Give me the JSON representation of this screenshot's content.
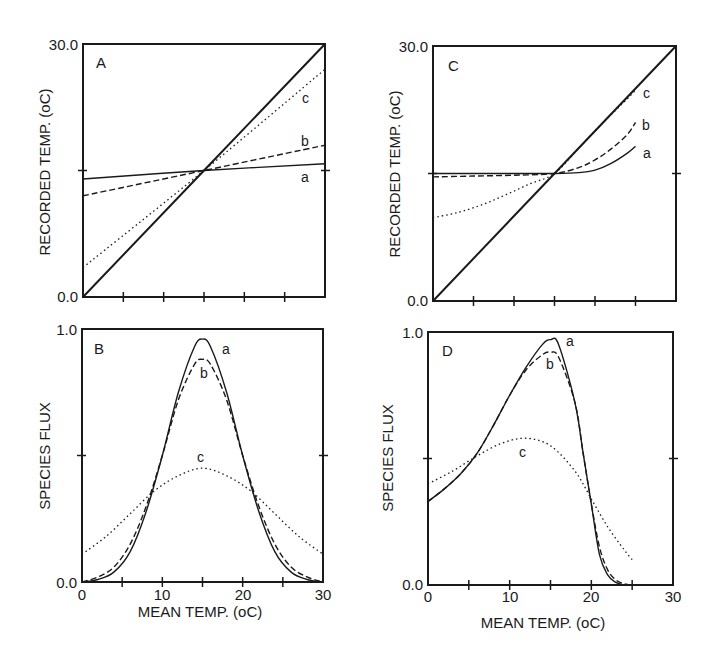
{
  "chart_data": [
    {
      "panel": "A",
      "type": "line",
      "xlabel": "",
      "ylabel": "RECORDED TEMP. (oC)",
      "xlim": [
        0,
        30
      ],
      "ylim": [
        0,
        30
      ],
      "yticks": [
        "0.0",
        "30.0"
      ],
      "grid": false,
      "series": [
        {
          "name": "1:1",
          "style": "solid-thick",
          "x": [
            0,
            30
          ],
          "y": [
            0,
            30
          ]
        },
        {
          "name": "a",
          "style": "solid",
          "x": [
            0,
            15,
            30
          ],
          "y": [
            14.0,
            15.0,
            15.8
          ]
        },
        {
          "name": "b",
          "style": "dashed",
          "x": [
            0,
            15,
            30
          ],
          "y": [
            12.0,
            15.0,
            18.0
          ]
        },
        {
          "name": "c",
          "style": "dotted",
          "x": [
            0,
            15,
            30
          ],
          "y": [
            3.5,
            15.0,
            27.0
          ]
        }
      ]
    },
    {
      "panel": "B",
      "type": "line",
      "xlabel": "MEAN TEMP. (oC)",
      "ylabel": "SPECIES FLUX",
      "xlim": [
        0,
        30
      ],
      "ylim": [
        0,
        1
      ],
      "xticks": [
        "0",
        "10",
        "20",
        "30"
      ],
      "yticks": [
        "0.0",
        "1.0"
      ],
      "grid": false,
      "series": [
        {
          "name": "a",
          "style": "solid",
          "x": [
            0,
            2,
            4,
            6,
            8,
            10,
            12,
            14,
            15,
            16,
            18,
            20,
            22,
            24,
            26,
            28,
            30
          ],
          "y": [
            0,
            0.01,
            0.04,
            0.12,
            0.28,
            0.5,
            0.75,
            0.93,
            0.96,
            0.93,
            0.75,
            0.5,
            0.28,
            0.12,
            0.04,
            0.01,
            0
          ]
        },
        {
          "name": "b",
          "style": "dashed",
          "x": [
            0,
            2,
            4,
            6,
            8,
            10,
            12,
            14,
            15,
            16,
            18,
            20,
            22,
            24,
            26,
            28,
            30
          ],
          "y": [
            0,
            0.02,
            0.06,
            0.15,
            0.3,
            0.5,
            0.72,
            0.86,
            0.88,
            0.86,
            0.72,
            0.5,
            0.3,
            0.15,
            0.06,
            0.02,
            0
          ]
        },
        {
          "name": "c",
          "style": "dotted",
          "x": [
            0,
            3,
            6,
            9,
            12,
            15,
            18,
            21,
            24,
            27,
            30
          ],
          "y": [
            0.11,
            0.18,
            0.27,
            0.36,
            0.42,
            0.45,
            0.42,
            0.36,
            0.27,
            0.18,
            0.11
          ]
        }
      ]
    },
    {
      "panel": "C",
      "type": "line",
      "xlabel": "",
      "ylabel": "RECORDED TEMP. (oC)",
      "xlim": [
        0,
        30
      ],
      "ylim": [
        0,
        30
      ],
      "yticks": [
        "0.0",
        "30.0"
      ],
      "grid": false,
      "series": [
        {
          "name": "1:1",
          "style": "solid-thick",
          "x": [
            0,
            30
          ],
          "y": [
            0,
            30
          ]
        },
        {
          "name": "a",
          "style": "solid",
          "x": [
            0,
            5,
            10,
            15,
            18,
            20,
            22,
            24,
            25
          ],
          "y": [
            15,
            15,
            15,
            15,
            15.1,
            15.4,
            16.2,
            17.4,
            18.2
          ]
        },
        {
          "name": "b",
          "style": "dashed",
          "x": [
            0,
            5,
            10,
            15,
            18,
            20,
            22,
            24,
            25
          ],
          "y": [
            14.6,
            14.7,
            14.8,
            15,
            15.7,
            16.6,
            17.9,
            19.6,
            21
          ]
        },
        {
          "name": "c",
          "style": "dotted",
          "x": [
            0,
            3,
            6,
            9,
            12,
            15,
            18,
            21,
            24,
            25
          ],
          "y": [
            9.8,
            10.4,
            11.3,
            12.5,
            13.8,
            15,
            18,
            21,
            23.8,
            24.8
          ]
        }
      ]
    },
    {
      "panel": "D",
      "type": "line",
      "xlabel": "MEAN TEMP. (oC)",
      "ylabel": "SPECIES FLUX",
      "xlim": [
        0,
        30
      ],
      "ylim": [
        0,
        1
      ],
      "xticks": [
        "0",
        "10",
        "20",
        "30"
      ],
      "yticks": [
        "0.0",
        "1.0"
      ],
      "grid": false,
      "series": [
        {
          "name": "a",
          "style": "solid",
          "x": [
            0,
            2,
            4,
            6,
            8,
            10,
            12,
            14,
            15,
            16,
            18,
            19,
            20,
            21,
            22,
            23,
            24
          ],
          "y": [
            0.33,
            0.38,
            0.44,
            0.52,
            0.63,
            0.75,
            0.86,
            0.95,
            0.97,
            0.95,
            0.72,
            0.52,
            0.32,
            0.12,
            0.04,
            0.01,
            0
          ]
        },
        {
          "name": "b",
          "style": "dashed",
          "x": [
            0,
            2,
            4,
            6,
            8,
            10,
            12,
            14,
            15,
            16,
            18,
            19,
            20,
            21,
            22,
            23,
            24,
            25
          ],
          "y": [
            0.33,
            0.38,
            0.44,
            0.52,
            0.63,
            0.75,
            0.85,
            0.91,
            0.92,
            0.9,
            0.72,
            0.52,
            0.32,
            0.15,
            0.06,
            0.02,
            0.005,
            0
          ]
        },
        {
          "name": "c",
          "style": "dotted",
          "x": [
            0,
            3,
            6,
            9,
            12,
            15,
            18,
            20,
            22,
            24,
            25
          ],
          "y": [
            0.4,
            0.45,
            0.51,
            0.56,
            0.58,
            0.55,
            0.45,
            0.34,
            0.23,
            0.14,
            0.1
          ]
        }
      ]
    }
  ],
  "panels": {
    "A": {
      "label": "A",
      "ylabel": "RECORDED TEMP. (oC)",
      "ytop": "30.0",
      "ybot": "0.0",
      "labels": {
        "a": "a",
        "b": "b",
        "c": "c"
      }
    },
    "B": {
      "label": "B",
      "ylabel": "SPECIES FLUX",
      "ytop": "1.0",
      "ybot": "0.0",
      "xlabel": "MEAN TEMP. (oC)",
      "xticks": [
        "0",
        "10",
        "20",
        "30"
      ],
      "labels": {
        "a": "a",
        "b": "b",
        "c": "c"
      }
    },
    "C": {
      "label": "C",
      "ylabel": "RECORDED TEMP. (oC)",
      "ytop": "30.0",
      "ybot": "0.0",
      "labels": {
        "a": "a",
        "b": "b",
        "c": "c"
      }
    },
    "D": {
      "label": "D",
      "ylabel": "SPECIES FLUX",
      "ytop": "1.0",
      "ybot": "0.0",
      "xlabel": "MEAN TEMP. (oC)",
      "xticks": [
        "0",
        "10",
        "20",
        "30"
      ],
      "labels": {
        "a": "a",
        "b": "b",
        "c": "c"
      }
    }
  }
}
